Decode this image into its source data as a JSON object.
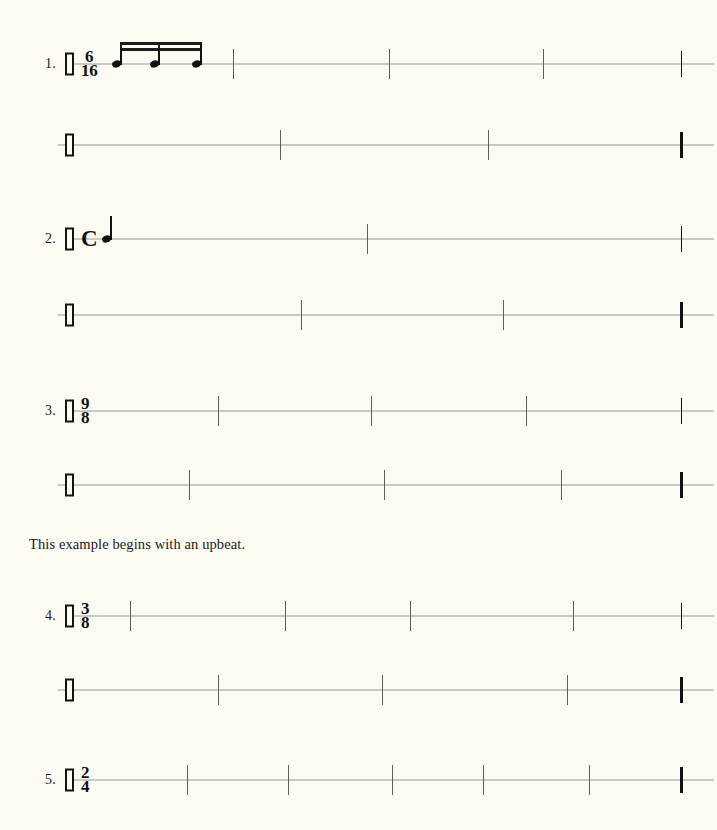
{
  "page": {
    "background_color": "#fbfbf2",
    "ink_color": "#111111",
    "staff_line_color": "#9a9a96",
    "barline_color": "#5e5e5c"
  },
  "instruction": {
    "text": "This example begins with an upbeat."
  },
  "exercises": [
    {
      "number": "1.",
      "time_signature": {
        "type": "numeric",
        "numerator": "6",
        "denominator": "16"
      },
      "clef": "rhythm-clef",
      "systems": [
        {
          "line": 1,
          "barline_count": 3,
          "end_barline": "thin",
          "notes": [
            {
              "type": "sixteenth",
              "beamed": true,
              "index": 1
            },
            {
              "type": "sixteenth",
              "beamed": true,
              "index": 2
            },
            {
              "type": "sixteenth",
              "beamed": true,
              "index": 3
            }
          ]
        },
        {
          "line": 2,
          "barline_count": 2,
          "end_barline": "final",
          "notes": []
        }
      ]
    },
    {
      "number": "2.",
      "time_signature": {
        "type": "common",
        "symbol": "C"
      },
      "clef": "rhythm-clef",
      "systems": [
        {
          "line": 1,
          "barline_count": 1,
          "end_barline": "thin",
          "notes": [
            {
              "type": "quarter",
              "beamed": false,
              "index": 1
            }
          ]
        },
        {
          "line": 2,
          "barline_count": 2,
          "end_barline": "final",
          "notes": []
        }
      ]
    },
    {
      "number": "3.",
      "time_signature": {
        "type": "numeric",
        "numerator": "9",
        "denominator": "8"
      },
      "clef": "rhythm-clef",
      "systems": [
        {
          "line": 1,
          "barline_count": 3,
          "end_barline": "thin",
          "notes": []
        },
        {
          "line": 2,
          "barline_count": 3,
          "end_barline": "final",
          "notes": []
        }
      ]
    },
    {
      "number": "4.",
      "time_signature": {
        "type": "numeric",
        "numerator": "3",
        "denominator": "8"
      },
      "clef": "rhythm-clef",
      "has_upbeat": true,
      "systems": [
        {
          "line": 1,
          "barline_count": 4,
          "end_barline": "thin",
          "notes": []
        },
        {
          "line": 2,
          "barline_count": 3,
          "end_barline": "final",
          "notes": []
        }
      ]
    },
    {
      "number": "5.",
      "time_signature": {
        "type": "numeric",
        "numerator": "2",
        "denominator": "4"
      },
      "clef": "rhythm-clef",
      "systems": [
        {
          "line": 1,
          "barline_count": 5,
          "end_barline": "final",
          "notes": []
        }
      ]
    }
  ]
}
